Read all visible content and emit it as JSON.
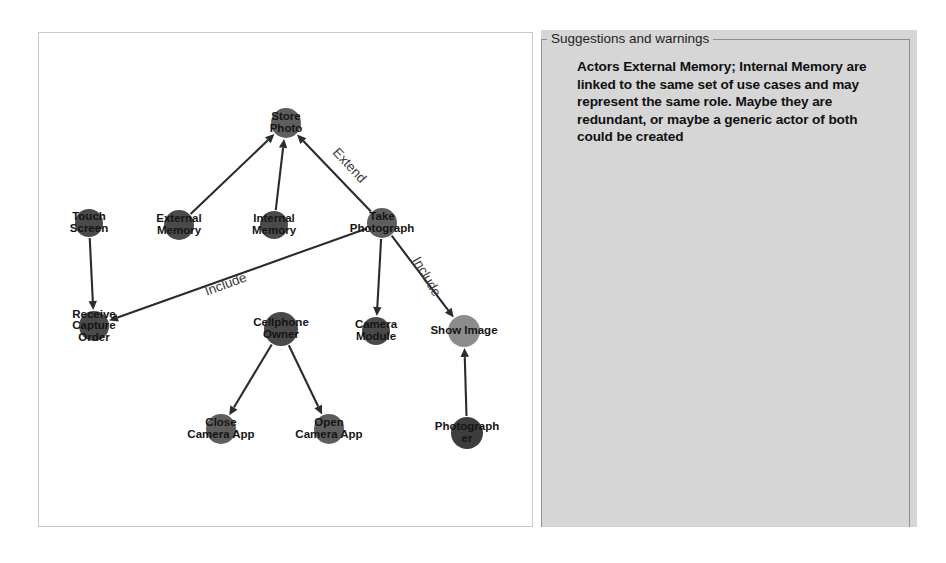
{
  "window": {
    "title": "Use Case Diagram Viewer"
  },
  "diagram": {
    "name": "use-case-diagram",
    "canvas": {
      "width": 495,
      "height": 495
    },
    "colors": {
      "actor_dark": "#4a4a4a",
      "usecase_mid": "#5e5e5e",
      "usecase_light": "#8c8c8c",
      "edge": "#2b2b2b",
      "canvas_background": "#ffffff",
      "panel_background": "#d6d6d6"
    },
    "nodes": [
      {
        "id": "touch_screen",
        "label": "Touch Screen",
        "lines": [
          "Touch",
          "Screen"
        ],
        "x": 50,
        "y": 190,
        "r": 14,
        "color": "#4a4a4a"
      },
      {
        "id": "external_memory",
        "label": "External Memory",
        "lines": [
          "External",
          "Memory"
        ],
        "x": 140,
        "y": 192,
        "r": 15,
        "color": "#4a4a4a"
      },
      {
        "id": "internal_memory",
        "label": "Internal Memory",
        "lines": [
          "Internal",
          "Memory"
        ],
        "x": 235,
        "y": 192,
        "r": 14,
        "color": "#4a4a4a"
      },
      {
        "id": "store_photo",
        "label": "Store Photo",
        "lines": [
          "Store",
          "Photo"
        ],
        "x": 247,
        "y": 90,
        "r": 15,
        "color": "#5e5e5e"
      },
      {
        "id": "take_photograph",
        "label": "Take Photograph",
        "lines": [
          "Take",
          "Photograph"
        ],
        "x": 343,
        "y": 190,
        "r": 15,
        "color": "#5e5e5e"
      },
      {
        "id": "receive_capture_order",
        "label": "Receive Capture Order",
        "lines": [
          "Receive",
          "Capture",
          "Order"
        ],
        "x": 55,
        "y": 293,
        "r": 15,
        "color": "#4a4a4a"
      },
      {
        "id": "cellphone_owner",
        "label": "Cellphone Owner",
        "lines": [
          "Cellphone",
          "Owner"
        ],
        "x": 242,
        "y": 296,
        "r": 17,
        "color": "#4a4a4a"
      },
      {
        "id": "camera_module",
        "label": "Camera Module",
        "lines": [
          "Camera",
          "Module"
        ],
        "x": 337,
        "y": 298,
        "r": 14,
        "color": "#4a4a4a"
      },
      {
        "id": "show_image",
        "label": "Show Image",
        "lines": [
          "Show Image"
        ],
        "x": 425,
        "y": 298,
        "r": 16,
        "color": "#8c8c8c"
      },
      {
        "id": "close_camera_app",
        "label": "Close Camera App",
        "lines": [
          "Close",
          "Camera App"
        ],
        "x": 182,
        "y": 396,
        "r": 15,
        "color": "#5e5e5e"
      },
      {
        "id": "open_camera_app",
        "label": "Open Camera App",
        "lines": [
          "Open",
          "Camera App"
        ],
        "x": 290,
        "y": 396,
        "r": 15,
        "color": "#5e5e5e"
      },
      {
        "id": "photographer",
        "label": "Photographer",
        "lines": [
          "Photograph",
          "er"
        ],
        "x": 428,
        "y": 400,
        "r": 16,
        "color": "#3d3d3d"
      }
    ],
    "edges": [
      {
        "id": "e1",
        "from": "touch_screen",
        "to": "receive_capture_order",
        "label": ""
      },
      {
        "id": "e2",
        "from": "external_memory",
        "to": "store_photo",
        "label": ""
      },
      {
        "id": "e3",
        "from": "internal_memory",
        "to": "store_photo",
        "label": ""
      },
      {
        "id": "e4",
        "from": "take_photograph",
        "to": "store_photo",
        "label": "Extend"
      },
      {
        "id": "e5",
        "from": "take_photograph",
        "to": "receive_capture_order",
        "label": "Include"
      },
      {
        "id": "e6",
        "from": "take_photograph",
        "to": "show_image",
        "label": "Include"
      },
      {
        "id": "e7",
        "from": "take_photograph",
        "to": "camera_module",
        "label": ""
      },
      {
        "id": "e8",
        "from": "cellphone_owner",
        "to": "close_camera_app",
        "label": ""
      },
      {
        "id": "e9",
        "from": "cellphone_owner",
        "to": "open_camera_app",
        "label": ""
      },
      {
        "id": "e10",
        "from": "photographer",
        "to": "show_image",
        "label": ""
      }
    ],
    "edge_labels": [
      {
        "id": "label_extend",
        "text": "Extend",
        "x": 310,
        "y": 133,
        "rotate": 47
      },
      {
        "id": "label_include1",
        "text": "Include",
        "x": 187,
        "y": 252,
        "rotate": -20
      },
      {
        "id": "label_include2",
        "text": "Include",
        "x": 387,
        "y": 244,
        "rotate": 60
      }
    ]
  },
  "suggestions": {
    "legend": "Suggestions and warnings",
    "body": "Actors External Memory; Internal Memory are linked to the same set of use cases and may represent the same role. Maybe they are redundant, or maybe a generic actor of both could be created"
  }
}
